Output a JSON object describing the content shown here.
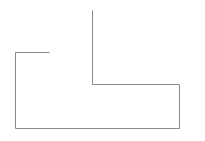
{
  "diagram": {
    "width": 205,
    "height": 141,
    "background": "#ffffff",
    "stroke_color": "#8a8a8a",
    "stroke_width": 1,
    "polyline": {
      "shape": "open-outline",
      "points": [
        [
          92,
          10
        ],
        [
          92,
          84
        ],
        [
          179,
          84
        ],
        [
          179,
          128
        ],
        [
          15,
          128
        ],
        [
          15,
          52
        ],
        [
          49,
          52
        ]
      ]
    }
  }
}
